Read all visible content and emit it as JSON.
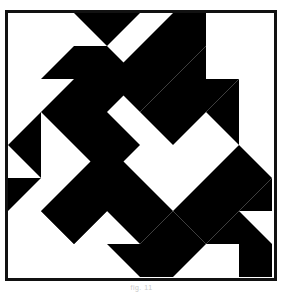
{
  "figure": {
    "kind": "quilt-block-diagram",
    "caption": "fig. 11",
    "colors": {
      "ink": "#000000",
      "paper": "#ffffff",
      "frame": "#111111",
      "caption": "#c9c9c9"
    },
    "frame": {
      "stroke_width": 3,
      "x": 1.5,
      "y": 1.5,
      "width": 269,
      "height": 268
    },
    "grid": {
      "columns": 8,
      "rows": 8,
      "cell": 33.25,
      "origin_x": 3,
      "origin_y": 3
    },
    "shapes": [
      {
        "name": "top-center-down-triangle",
        "fill": "#000000",
        "points": "69,3 135,3 102,36"
      },
      {
        "name": "upper-left-chevron",
        "fill": "#000000",
        "points": "102,36 135,69 102,102 135,135 102,168 36,102 69,69 36,69 69,36"
      },
      {
        "name": "upper-right-diagonal-band",
        "fill": "#000000",
        "points": "201,3 168,3 102,69 135,102 201,36"
      },
      {
        "name": "right-upper-wedge",
        "fill": "#000000",
        "points": "201,36 135,102 168,135 201,102 234,135 234,69 201,102"
      },
      {
        "name": "top-right-inset-triangle",
        "fill": "#000000",
        "points": "201,102 234,69 168,69"
      },
      {
        "name": "right-lower-diagonal-band",
        "fill": "#000000",
        "points": "234,135 267,168 201,234 168,201"
      },
      {
        "name": "left-mid-triangle",
        "fill": "#000000",
        "points": "3,135 36,102 36,168"
      },
      {
        "name": "left-lower-triangle",
        "fill": "#000000",
        "points": "3,168 36,168 3,201"
      },
      {
        "name": "center-left-chevron",
        "fill": "#000000",
        "points": "102,135 168,201 135,234 102,201 69,234 36,201 69,168"
      },
      {
        "name": "bottom-left-inset-triangle",
        "fill": "#000000",
        "points": "36,201 102,201 69,234"
      },
      {
        "name": "bottom-center-chevron",
        "fill": "#000000",
        "points": "135,234 168,201 201,234 168,267 135,267 102,234"
      },
      {
        "name": "bottom-right-chevron",
        "fill": "#000000",
        "points": "201,234 234,201 267,234 267,267 234,267 234,234"
      },
      {
        "name": "right-edge-lower-triangle",
        "fill": "#000000",
        "points": "267,168 267,201 234,201"
      }
    ]
  }
}
